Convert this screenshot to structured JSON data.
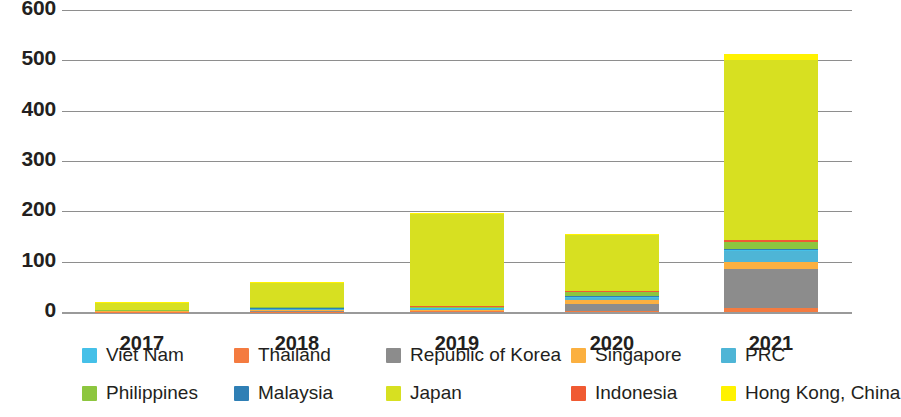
{
  "chart_data": {
    "type": "bar",
    "title": "",
    "xlabel": "",
    "ylabel": "",
    "stacked": true,
    "grid": true,
    "legend_position": "bottom",
    "categories": [
      "2017",
      "2018",
      "2019",
      "2020",
      "2021"
    ],
    "ylim": [
      0,
      600
    ],
    "yticks": [
      0,
      100,
      200,
      300,
      400,
      500,
      600
    ],
    "series": [
      {
        "name": "Thailand",
        "color": "#f47b40",
        "values": [
          0.5,
          1,
          2,
          2,
          8
        ]
      },
      {
        "name": "Republic of Korea",
        "color": "#8c8c8c",
        "values": [
          0.5,
          1,
          1,
          14,
          77
        ]
      },
      {
        "name": "Singapore",
        "color": "#fbb040",
        "values": [
          0.5,
          1.5,
          2,
          8,
          14
        ]
      },
      {
        "name": "PRC",
        "color": "#4eb5d6",
        "values": [
          0.5,
          2,
          2,
          3,
          22
        ]
      },
      {
        "name": "Viet Nam",
        "color": "#45c0e8",
        "values": [
          0.5,
          1,
          1,
          2,
          2
        ]
      },
      {
        "name": "Malaysia",
        "color": "#2f7fb5",
        "values": [
          0.5,
          1,
          1,
          2,
          2
        ]
      },
      {
        "name": "Philippines",
        "color": "#8dc63f",
        "values": [
          0.5,
          2,
          2,
          9,
          14
        ]
      },
      {
        "name": "Indonesia",
        "color": "#f05a32",
        "values": [
          0.5,
          1,
          1,
          2,
          4
        ]
      },
      {
        "name": "Japan",
        "color": "#d7e021",
        "values": [
          14,
          47,
          182,
          112,
          358
        ]
      },
      {
        "name": "Hong Kong, China",
        "color": "#fff200",
        "values": [
          2,
          2,
          2,
          2,
          12
        ]
      }
    ],
    "totals": [
      20,
      59.5,
      196,
      156,
      513
    ],
    "stack_order_bottom_to_top": [
      "Thailand",
      "Republic of Korea",
      "Singapore",
      "PRC",
      "Viet Nam",
      "Malaysia",
      "Philippines",
      "Indonesia",
      "Japan",
      "Hong Kong, China"
    ]
  },
  "legend": {
    "items": [
      {
        "label": "Viet Nam",
        "color": "#45c0e8"
      },
      {
        "label": "Thailand",
        "color": "#f47b40"
      },
      {
        "label": "Republic of Korea",
        "color": "#8c8c8c"
      },
      {
        "label": "Singapore",
        "color": "#fbb040"
      },
      {
        "label": "PRC",
        "color": "#4eb5d6"
      },
      {
        "label": "Philippines",
        "color": "#8dc63f"
      },
      {
        "label": "Malaysia",
        "color": "#2f7fb5"
      },
      {
        "label": "Japan",
        "color": "#d7e021"
      },
      {
        "label": "Indonesia",
        "color": "#f05a32"
      },
      {
        "label": "Hong Kong, China",
        "color": "#fff200"
      }
    ]
  }
}
